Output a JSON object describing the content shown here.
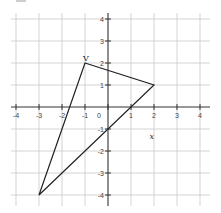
{
  "chart_data": {
    "type": "line",
    "title": "",
    "xlabel": "x",
    "ylabel": "",
    "xlim": [
      -4,
      4
    ],
    "ylim": [
      -4,
      4
    ],
    "grid": true,
    "x_ticks": [
      -4,
      -3,
      -2,
      -1,
      0,
      1,
      2,
      3,
      4
    ],
    "y_ticks": [
      4,
      3,
      2,
      1,
      -1,
      -2,
      -3,
      -4
    ],
    "x_tick_labels": [
      "-4",
      "-3",
      "-2",
      "-1",
      "0",
      "1",
      "2",
      "3",
      "4"
    ],
    "y_tick_labels": [
      "4",
      "3",
      "2",
      "1",
      "-1",
      "-2",
      "-3",
      "-4"
    ],
    "series": [
      {
        "name": "triangle",
        "closed": true,
        "points": [
          {
            "x": -1,
            "y": 2,
            "label": "V"
          },
          {
            "x": 2,
            "y": 1,
            "label": ""
          },
          {
            "x": -3,
            "y": -4,
            "label": ""
          }
        ]
      }
    ],
    "annotations": [
      {
        "text": "V",
        "x": -1,
        "y": 2
      },
      {
        "text": "x",
        "x": 1.9,
        "y": -1.3
      }
    ]
  },
  "style": {
    "grid_color": "#c8c8c8",
    "axis_color": "#333333",
    "line_color": "#222222"
  }
}
